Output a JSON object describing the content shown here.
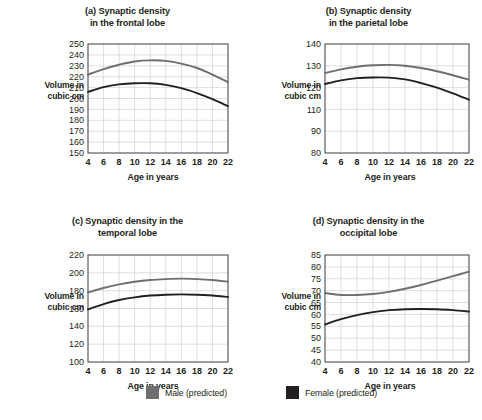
{
  "figure": {
    "background_color": "#ffffff",
    "axis_color": "#58595b",
    "grid_color": "#c9cacc",
    "text_color": "#231f20"
  },
  "legend": {
    "position": "bottom-center",
    "entries": [
      {
        "label": "Male (predicted)",
        "color": "#6e6e6e",
        "swatch_name": "male-swatch"
      },
      {
        "label": "Female (predicted)",
        "color": "#231f20",
        "swatch_name": "female-swatch"
      }
    ]
  },
  "chart_data": [
    {
      "id": "a",
      "type": "line",
      "title": "(a) Synaptic density in the frontal lobe",
      "title_lines": [
        "(a) Synaptic density",
        "in the frontal lobe"
      ],
      "xlabel": "Age in years",
      "ylabel": "Volume in cubic cm",
      "ylabel_lines": [
        "Volume in",
        "cubic cm"
      ],
      "x": [
        4,
        6,
        8,
        10,
        12,
        14,
        16,
        18,
        20,
        22
      ],
      "xticks": [
        4,
        6,
        8,
        10,
        12,
        14,
        16,
        18,
        20,
        22
      ],
      "yticks": [
        150,
        160,
        170,
        180,
        190,
        200,
        210,
        220,
        230,
        240,
        250
      ],
      "xlim": [
        4,
        22
      ],
      "ylim": [
        150,
        250
      ],
      "grid": true,
      "series": [
        {
          "name": "Male (predicted)",
          "color": "#6e6e6e",
          "values": [
            222,
            227,
            231,
            234,
            235,
            234.5,
            232,
            228,
            222,
            215
          ]
        },
        {
          "name": "Female (predicted)",
          "color": "#231f20",
          "values": [
            206,
            210.5,
            213,
            214,
            214,
            212.5,
            209.5,
            205,
            199.5,
            193
          ]
        }
      ]
    },
    {
      "id": "b",
      "type": "line",
      "title": "(b) Synaptic density in the parietal lobe",
      "title_lines": [
        "(b) Synaptic density",
        "in the parietal lobe"
      ],
      "xlabel": "Age in years",
      "ylabel": "Volume in cubic cm",
      "ylabel_lines": [
        "Volume in",
        "cubic cm"
      ],
      "x": [
        4,
        6,
        8,
        10,
        12,
        14,
        16,
        18,
        20,
        22
      ],
      "xticks": [
        4,
        6,
        8,
        10,
        12,
        14,
        16,
        18,
        20,
        22
      ],
      "yticks": [
        80,
        90,
        110,
        120,
        130,
        140
      ],
      "ytick_fractions": [
        0,
        0.2,
        0.4,
        0.6,
        0.8,
        1.0
      ],
      "xlim": [
        4,
        22
      ],
      "ylim": [
        80,
        140
      ],
      "grid": true,
      "series": [
        {
          "name": "Male (predicted)",
          "color": "#6e6e6e",
          "values": [
            124,
            126,
            127.5,
            128.3,
            128.5,
            128,
            126.8,
            125,
            122.8,
            120.3
          ]
        },
        {
          "name": "Female (predicted)",
          "color": "#231f20",
          "values": [
            118,
            120,
            121.2,
            121.6,
            121.5,
            120.5,
            118.5,
            116,
            112.8,
            109.3
          ]
        }
      ]
    },
    {
      "id": "c",
      "type": "line",
      "title": "(c) Synaptic density in the temporal lobe",
      "title_lines": [
        "(c) Synaptic density in the",
        "temporal lobe"
      ],
      "xlabel": "Age in years",
      "ylabel": "Volume in cubic cm",
      "ylabel_lines": [
        "Volume in",
        "cubic cm"
      ],
      "x": [
        4,
        6,
        8,
        10,
        12,
        14,
        16,
        18,
        20,
        22
      ],
      "xticks": [
        4,
        6,
        8,
        10,
        12,
        14,
        16,
        18,
        20,
        22
      ],
      "yticks": [
        100,
        120,
        140,
        160,
        180,
        200,
        220
      ],
      "xlim": [
        4,
        22
      ],
      "ylim": [
        100,
        220
      ],
      "grid": true,
      "series": [
        {
          "name": "Male (predicted)",
          "color": "#6e6e6e",
          "values": [
            178,
            183,
            187,
            190,
            192,
            193,
            193.5,
            193,
            192,
            190
          ]
        },
        {
          "name": "Female (predicted)",
          "color": "#231f20",
          "values": [
            159,
            165,
            169.5,
            172.5,
            174.5,
            175.5,
            175.8,
            175.5,
            174.5,
            173
          ]
        }
      ]
    },
    {
      "id": "d",
      "type": "line",
      "title": "(d) Synaptic density in the occipital lobe",
      "title_lines": [
        "(d) Synaptic density in the",
        "occipital lobe"
      ],
      "xlabel": "Age in years",
      "ylabel": "Volume in cubic cm",
      "ylabel_lines": [
        "Volume in",
        "cubic cm"
      ],
      "x": [
        4,
        6,
        8,
        10,
        12,
        14,
        16,
        18,
        20,
        22
      ],
      "xticks": [
        4,
        6,
        8,
        10,
        12,
        14,
        16,
        18,
        20,
        22
      ],
      "yticks": [
        40,
        45,
        50,
        55,
        60,
        65,
        70,
        75,
        80,
        85
      ],
      "xlim": [
        4,
        22
      ],
      "ylim": [
        40,
        85
      ],
      "grid": true,
      "series": [
        {
          "name": "Male (predicted)",
          "color": "#6e6e6e",
          "values": [
            69,
            68.2,
            68.2,
            68.6,
            69.5,
            70.8,
            72.4,
            74.2,
            76.1,
            78
          ]
        },
        {
          "name": "Female (predicted)",
          "color": "#231f20",
          "values": [
            55.8,
            58,
            59.7,
            61,
            61.8,
            62.2,
            62.3,
            62.2,
            61.8,
            61.2
          ]
        }
      ]
    }
  ]
}
